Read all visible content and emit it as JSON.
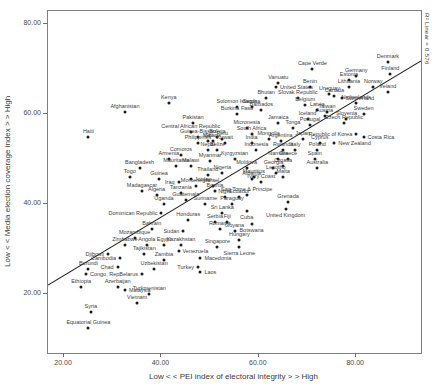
{
  "chart_data": {
    "type": "scatter",
    "title": "",
    "xlabel": "Low < < PEI index of electoral integrity > > High",
    "ylabel": "Low < < Media election coverage index > > High",
    "annotation": "R² Linear = 0.576",
    "axis": {
      "xmin": 16.7,
      "xmax": 93.3,
      "ymin": 6.9,
      "ymax": 82.9
    },
    "grid": false,
    "legend": "none",
    "xticks": [
      {
        "v": 20,
        "label": "20.00"
      },
      {
        "v": 40,
        "label": "40.00"
      },
      {
        "v": 60,
        "label": "60.00"
      },
      {
        "v": 80,
        "label": "80.00"
      }
    ],
    "yticks": [
      {
        "v": 20,
        "label": "20.00"
      },
      {
        "v": 40,
        "label": "40.00"
      },
      {
        "v": 60,
        "label": "60.00"
      },
      {
        "v": 80,
        "label": "80.00"
      }
    ],
    "trendline": {
      "x1": 16.7,
      "y1": 22.0,
      "x2": 93.3,
      "y2": 71.8,
      "color": "#222222"
    },
    "point_color": "#1c1c1c",
    "points": [
      {
        "n": "Denmark",
        "x": 86.5,
        "y": 71.5
      },
      {
        "n": "Finland",
        "x": 87,
        "y": 69
      },
      {
        "n": "Norway",
        "x": 83.5,
        "y": 66
      },
      {
        "n": "Ireland",
        "x": 86.5,
        "y": 65
      },
      {
        "n": "Germany",
        "x": 80,
        "y": 68.5
      },
      {
        "n": "Estonia",
        "x": 78.5,
        "y": 67.5
      },
      {
        "n": "Lithuania",
        "x": 78.5,
        "y": 66
      },
      {
        "n": "Sweden",
        "x": 81.5,
        "y": 60
      },
      {
        "n": "Netherlands",
        "x": 80,
        "y": 62.5
      },
      {
        "n": "Switzerland",
        "x": 77,
        "y": 63.5,
        "lp": "right"
      },
      {
        "n": "Canada",
        "x": 75.5,
        "y": 64
      },
      {
        "n": "Austria",
        "x": 73.5,
        "y": 59.5
      },
      {
        "n": "Slovenia",
        "x": 78,
        "y": 59
      },
      {
        "n": "Czech Republic",
        "x": 77.5,
        "y": 58
      },
      {
        "n": "Costa Rica",
        "x": 81.5,
        "y": 55,
        "lp": "right"
      },
      {
        "n": "Republic of Korea",
        "x": 80,
        "y": 55.5,
        "lp": "left"
      },
      {
        "n": "New Zealand",
        "x": 75.5,
        "y": 53.5,
        "lp": "right"
      },
      {
        "n": "Cape Verde",
        "x": 71,
        "y": 70
      },
      {
        "n": "Benin",
        "x": 70.5,
        "y": 66
      },
      {
        "n": "Vanuatu",
        "x": 64,
        "y": 67
      },
      {
        "n": "United States",
        "x": 63.5,
        "y": 66,
        "lp": "right"
      },
      {
        "n": "Uruguay",
        "x": 74.5,
        "y": 64.5
      },
      {
        "n": "Bhutan",
        "x": 61.5,
        "y": 63.5
      },
      {
        "n": "Slovak Republic",
        "x": 68,
        "y": 63.5
      },
      {
        "n": "Belgium",
        "x": 69.5,
        "y": 62
      },
      {
        "n": "Latvia",
        "x": 72,
        "y": 61
      },
      {
        "n": "Taiwan",
        "x": 74,
        "y": 60.5
      },
      {
        "n": "Iceland",
        "x": 70,
        "y": 59
      },
      {
        "n": "Portugal",
        "x": 70.5,
        "y": 57.5
      },
      {
        "n": "Tonga",
        "x": 67,
        "y": 57
      },
      {
        "n": "Japan",
        "x": 69,
        "y": 54.5
      },
      {
        "n": "Cyprus",
        "x": 72.5,
        "y": 53.5
      },
      {
        "n": "Poland",
        "x": 72,
        "y": 52
      },
      {
        "n": "Italy",
        "x": 67.5,
        "y": 52
      },
      {
        "n": "Spain",
        "x": 71.5,
        "y": 50
      },
      {
        "n": "Greece",
        "x": 66,
        "y": 50
      },
      {
        "n": "Croatia",
        "x": 65,
        "y": 48.5
      },
      {
        "n": "Australia",
        "x": 72,
        "y": 48
      },
      {
        "n": "Namibia",
        "x": 64,
        "y": 50
      },
      {
        "n": "Georgia",
        "x": 63,
        "y": 48
      },
      {
        "n": "Lesotho",
        "x": 63.5,
        "y": 47
      },
      {
        "n": "Moldova",
        "x": 57.5,
        "y": 48
      },
      {
        "n": "Mauritius",
        "x": 59,
        "y": 46
      },
      {
        "n": "Malta",
        "x": 65,
        "y": 46
      },
      {
        "n": "Albania",
        "x": 58.5,
        "y": 45.5
      },
      {
        "n": "Ivory Coast",
        "x": 60.5,
        "y": 45
      },
      {
        "n": "Jordan",
        "x": 46,
        "y": 45.5,
        "lp": "right"
      },
      {
        "n": "Thailand",
        "x": 49.5,
        "y": 46.5
      },
      {
        "n": "Montenegro",
        "x": 47,
        "y": 44
      },
      {
        "n": "Israel",
        "x": 50.5,
        "y": 44
      },
      {
        "n": "Bosnia",
        "x": 51,
        "y": 43
      },
      {
        "n": "Tanzania",
        "x": 44,
        "y": 42.5
      },
      {
        "n": "Niger",
        "x": 53,
        "y": 41.5
      },
      {
        "n": "Ecuador",
        "x": 56,
        "y": 41.5
      },
      {
        "n": "Sao Tome & Principe",
        "x": 57.5,
        "y": 42
      },
      {
        "n": "Grenada",
        "x": 66,
        "y": 40.5
      },
      {
        "n": "Guatemala",
        "x": 45,
        "y": 41
      },
      {
        "n": "Suriname",
        "x": 49,
        "y": 40
      },
      {
        "n": "Paraguay",
        "x": 54.5,
        "y": 40
      },
      {
        "n": "Sri Lanka",
        "x": 52.5,
        "y": 38
      },
      {
        "n": "Cuba",
        "x": 57.5,
        "y": 38.5,
        "lp": "below"
      },
      {
        "n": "United Kingdom",
        "x": 65.5,
        "y": 39,
        "lp": "below"
      },
      {
        "n": "Honduras",
        "x": 45.5,
        "y": 36.5
      },
      {
        "n": "Serbia",
        "x": 51,
        "y": 36
      },
      {
        "n": "Fiji",
        "x": 53.5,
        "y": 36
      },
      {
        "n": "Sudan",
        "x": 44.5,
        "y": 34,
        "lp": "left"
      },
      {
        "n": "Romania",
        "x": 52,
        "y": 34.5
      },
      {
        "n": "Guyana",
        "x": 55,
        "y": 34
      },
      {
        "n": "Botswana",
        "x": 58.5,
        "y": 35.5,
        "lp": "below"
      },
      {
        "n": "Hungary",
        "x": 56,
        "y": 32
      },
      {
        "n": "Kazakhstan",
        "x": 44,
        "y": 31
      },
      {
        "n": "Singapore",
        "x": 51.5,
        "y": 30.5
      },
      {
        "n": "Venezuela",
        "x": 43.5,
        "y": 29.5,
        "lp": "right"
      },
      {
        "n": "Sierra Leone",
        "x": 56,
        "y": 30.5,
        "lp": "below"
      },
      {
        "n": "Macedonia",
        "x": 48,
        "y": 28,
        "lp": "right"
      },
      {
        "n": "Turkey",
        "x": 47.5,
        "y": 26,
        "lp": "left"
      },
      {
        "n": "Laos",
        "x": 48,
        "y": 25,
        "lp": "right"
      },
      {
        "n": "Zambia",
        "x": 40.5,
        "y": 27.5
      },
      {
        "n": "Cambodia",
        "x": 31.5,
        "y": 28,
        "lp": "left"
      },
      {
        "n": "Djibouti",
        "x": 29,
        "y": 29,
        "lp": "left"
      },
      {
        "n": "Tajikistan",
        "x": 36.5,
        "y": 29
      },
      {
        "n": "Uzbekistan",
        "x": 38.5,
        "y": 25.5
      },
      {
        "n": "Burundi",
        "x": 25,
        "y": 25.5
      },
      {
        "n": "Chad",
        "x": 31,
        "y": 26,
        "lp": "left"
      },
      {
        "n": "Congo, Rep.",
        "x": 24.5,
        "y": 24.5,
        "lp": "right"
      },
      {
        "n": "Belarus",
        "x": 36,
        "y": 24.5,
        "lp": "left"
      },
      {
        "n": "Ethiopia",
        "x": 23.5,
        "y": 21.5
      },
      {
        "n": "Azerbaijan",
        "x": 31,
        "y": 21.5
      },
      {
        "n": "Malaysia",
        "x": 32.5,
        "y": 21,
        "lp": "right"
      },
      {
        "n": "Turkmenistan",
        "x": 37.5,
        "y": 20
      },
      {
        "n": "Vietnam",
        "x": 35,
        "y": 18
      },
      {
        "n": "Syria",
        "x": 25.5,
        "y": 16
      },
      {
        "n": "Equatorial Guinea",
        "x": 25,
        "y": 12.5
      },
      {
        "n": "Kenya",
        "x": 41.5,
        "y": 62.5
      },
      {
        "n": "Afghanistan",
        "x": 32.5,
        "y": 60.5
      },
      {
        "n": "Haiti",
        "x": 25,
        "y": 55
      },
      {
        "n": "Pakistan",
        "x": 46.5,
        "y": 58
      },
      {
        "n": "Central African Republic",
        "x": 46,
        "y": 56
      },
      {
        "n": "Guinea-Bissau",
        "x": 47.5,
        "y": 55
      },
      {
        "n": "Bolivia",
        "x": 51.5,
        "y": 55
      },
      {
        "n": "Solomon Islands",
        "x": 55.5,
        "y": 61.5
      },
      {
        "n": "Samoa",
        "x": 58.5,
        "y": 61.5
      },
      {
        "n": "Burkina Faso",
        "x": 55.5,
        "y": 60
      },
      {
        "n": "Barbados",
        "x": 60.5,
        "y": 61
      },
      {
        "n": "Jamaica",
        "x": 64,
        "y": 58
      },
      {
        "n": "Micronesia",
        "x": 57.5,
        "y": 57
      },
      {
        "n": "South Africa",
        "x": 58.5,
        "y": 55.5
      },
      {
        "n": "Mali",
        "x": 49.5,
        "y": 54
      },
      {
        "n": "Ghana",
        "x": 50.5,
        "y": 54
      },
      {
        "n": "Peru",
        "x": 52.5,
        "y": 54.5
      },
      {
        "n": "Mongolia",
        "x": 62,
        "y": 54.5
      },
      {
        "n": "Kuwait",
        "x": 53,
        "y": 53.5
      },
      {
        "n": "India",
        "x": 58.5,
        "y": 53.5
      },
      {
        "n": "Philippines",
        "x": 47.5,
        "y": 53.5
      },
      {
        "n": "Nepal",
        "x": 49.5,
        "y": 52
      },
      {
        "n": "Belize",
        "x": 51.5,
        "y": 52
      },
      {
        "n": "Indonesia",
        "x": 59.5,
        "y": 52
      },
      {
        "n": "Rwanda",
        "x": 65,
        "y": 52
      },
      {
        "n": "Argentina",
        "x": 64.5,
        "y": 54
      },
      {
        "n": "Myanmar",
        "x": 50,
        "y": 49.5
      },
      {
        "n": "Kyrgyzstan",
        "x": 55,
        "y": 50
      },
      {
        "n": "Armenia",
        "x": 41.5,
        "y": 50
      },
      {
        "n": "Comoros",
        "x": 44,
        "y": 51
      },
      {
        "n": "Mauritania",
        "x": 43,
        "y": 48.5
      },
      {
        "n": "Malawi",
        "x": 46,
        "y": 48.5
      },
      {
        "n": "Bangladesh",
        "x": 35.5,
        "y": 48
      },
      {
        "n": "Togo",
        "x": 33.5,
        "y": 46
      },
      {
        "n": "Guinea",
        "x": 39.5,
        "y": 45.5
      },
      {
        "n": "Iraq",
        "x": 43.5,
        "y": 45,
        "lp": "left"
      },
      {
        "n": "Madagascar",
        "x": 36,
        "y": 43
      },
      {
        "n": "Algeria",
        "x": 39,
        "y": 42
      },
      {
        "n": "Uganda",
        "x": 40.5,
        "y": 40
      },
      {
        "n": "Dominican Republic",
        "x": 40,
        "y": 38,
        "lp": "left"
      },
      {
        "n": "Bahrain",
        "x": 38,
        "y": 34.5
      },
      {
        "n": "Mozambique",
        "x": 34.5,
        "y": 32.5
      },
      {
        "n": "Zimbabwe",
        "x": 32.5,
        "y": 31
      },
      {
        "n": "Angola",
        "x": 37,
        "y": 31
      },
      {
        "n": "Egypt",
        "x": 40.5,
        "y": 31
      },
      {
        "n": "Nigeria",
        "x": 52.5,
        "y": 47
      }
    ]
  }
}
